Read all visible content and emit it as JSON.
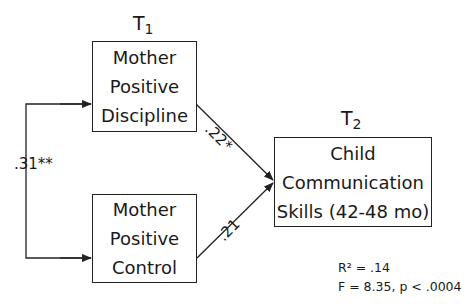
{
  "diagram": {
    "time_labels": {
      "t1": {
        "letter": "T",
        "sub": "1"
      },
      "t2": {
        "letter": "T",
        "sub": "2"
      }
    },
    "nodes": {
      "mother_discipline": [
        "Mother",
        "Positive",
        "Discipline"
      ],
      "mother_control": [
        "Mother",
        "Positive",
        "Control"
      ],
      "child_comm": [
        "Child",
        "Communication",
        "Skills (42-48 mo)"
      ]
    },
    "paths": {
      "discipline_to_child": ".22*",
      "control_to_child": ".21",
      "covariance": ".31**"
    },
    "stats": {
      "r2": "R² = .14",
      "f": "F = 8.35, p < .0004"
    },
    "colors": {
      "line": "#222222",
      "text": "#1a1a1a"
    }
  }
}
